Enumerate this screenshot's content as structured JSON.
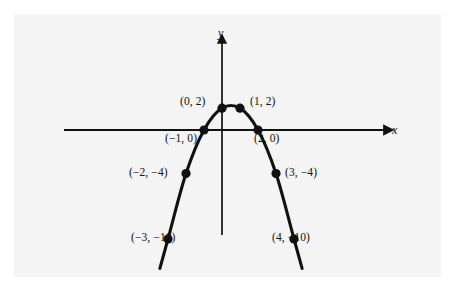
{
  "figure": {
    "background_color": "#ffffff",
    "panel_color": "#f4f4f4",
    "ink_color": "#111111"
  },
  "axes": {
    "x_label": "x",
    "y_label": "y",
    "x_label_pos": {
      "left": 392,
      "top": 124
    },
    "y_label_pos": {
      "left": 218,
      "top": 27
    }
  },
  "chart_data": {
    "type": "scatter",
    "title": "",
    "xlabel": "x",
    "ylabel": "y",
    "grid": false,
    "legend": null,
    "xlim": [
      -4.2,
      9.4
    ],
    "ylim": [
      -11.5,
      9.5
    ],
    "x": [
      -3,
      -2,
      -1,
      0,
      1,
      2,
      3,
      4
    ],
    "y": [
      -10,
      -4,
      0,
      2,
      2,
      0,
      -4,
      -10
    ],
    "point_labels": [
      "(−3, −10)",
      "(−2, −4)",
      "(−1, 0)",
      "(0, 2)",
      "(1, 2)",
      "(2, 0)",
      "(3, −4)",
      "(4, −10)"
    ],
    "annotations": [
      {
        "text": "(0, 2)",
        "point": [
          0,
          2
        ],
        "left": 180,
        "top": 96,
        "align": "right"
      },
      {
        "text": "(1, 2)",
        "point": [
          1,
          2
        ],
        "left": 250,
        "top": 96,
        "align": "left"
      },
      {
        "text": "(−1, 0)",
        "point": [
          -1,
          0
        ],
        "left": 165,
        "top": 133,
        "align": "left"
      },
      {
        "text": "(2, 0)",
        "point": [
          2,
          0
        ],
        "left": 254,
        "top": 133,
        "align": "left"
      },
      {
        "text": "(−2, −4)",
        "point": [
          -2,
          -4
        ],
        "left": 129,
        "top": 167,
        "align": "left"
      },
      {
        "text": "(3, −4)",
        "point": [
          3,
          -4
        ],
        "left": 285,
        "top": 167,
        "align": "left"
      },
      {
        "text": "(−3, −10)",
        "point": [
          -3,
          -10
        ],
        "left": 131,
        "top": 232,
        "align": "left"
      },
      {
        "text": "(4, −10)",
        "point": [
          4,
          -10
        ],
        "left": 272,
        "top": 232,
        "align": "left"
      }
    ]
  }
}
